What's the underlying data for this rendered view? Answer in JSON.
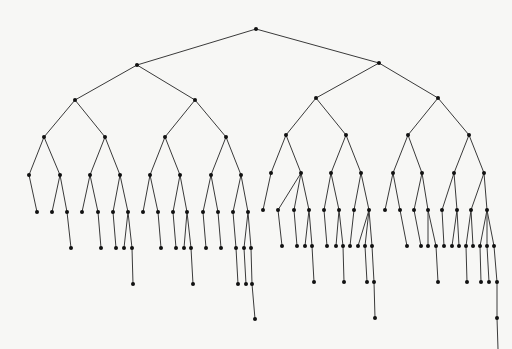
{
  "diagram": {
    "type": "binary-tree",
    "edge_color": "#3a3a3a",
    "node_color": "#111111",
    "background": "#f7f7f5",
    "node_radius": 2,
    "nodes": [
      {
        "id": 0,
        "x": 256,
        "y": 29,
        "parent": null
      },
      {
        "id": 1,
        "x": 137,
        "y": 65,
        "parent": 0
      },
      {
        "id": 2,
        "x": 379,
        "y": 63,
        "parent": 0
      },
      {
        "id": 3,
        "x": 75,
        "y": 100,
        "parent": 1
      },
      {
        "id": 4,
        "x": 195,
        "y": 100,
        "parent": 1
      },
      {
        "id": 5,
        "x": 316,
        "y": 98,
        "parent": 2
      },
      {
        "id": 6,
        "x": 438,
        "y": 98,
        "parent": 2
      },
      {
        "id": 7,
        "x": 44,
        "y": 137,
        "parent": 3
      },
      {
        "id": 8,
        "x": 105,
        "y": 137,
        "parent": 3
      },
      {
        "id": 9,
        "x": 165,
        "y": 137,
        "parent": 4
      },
      {
        "id": 10,
        "x": 226,
        "y": 137,
        "parent": 4
      },
      {
        "id": 11,
        "x": 286,
        "y": 135,
        "parent": 5
      },
      {
        "id": 12,
        "x": 346,
        "y": 135,
        "parent": 5
      },
      {
        "id": 13,
        "x": 408,
        "y": 135,
        "parent": 6
      },
      {
        "id": 14,
        "x": 469,
        "y": 135,
        "parent": 6
      },
      {
        "id": 15,
        "x": 29,
        "y": 175,
        "parent": 7
      },
      {
        "id": 16,
        "x": 60,
        "y": 175,
        "parent": 7
      },
      {
        "id": 17,
        "x": 90,
        "y": 175,
        "parent": 8
      },
      {
        "id": 18,
        "x": 120,
        "y": 175,
        "parent": 8
      },
      {
        "id": 19,
        "x": 150,
        "y": 175,
        "parent": 9
      },
      {
        "id": 20,
        "x": 180,
        "y": 175,
        "parent": 9
      },
      {
        "id": 21,
        "x": 211,
        "y": 175,
        "parent": 10
      },
      {
        "id": 22,
        "x": 241,
        "y": 175,
        "parent": 10
      },
      {
        "id": 23,
        "x": 271,
        "y": 173,
        "parent": 11
      },
      {
        "id": 24,
        "x": 301,
        "y": 173,
        "parent": 11
      },
      {
        "id": 25,
        "x": 331,
        "y": 173,
        "parent": 12
      },
      {
        "id": 26,
        "x": 361,
        "y": 173,
        "parent": 12
      },
      {
        "id": 27,
        "x": 393,
        "y": 173,
        "parent": 13
      },
      {
        "id": 28,
        "x": 422,
        "y": 173,
        "parent": 13
      },
      {
        "id": 29,
        "x": 454,
        "y": 173,
        "parent": 14
      },
      {
        "id": 30,
        "x": 484,
        "y": 173,
        "parent": 14
      },
      {
        "id": 31,
        "x": 37,
        "y": 212,
        "parent": 15
      },
      {
        "id": 32,
        "x": 52,
        "y": 212,
        "parent": 16
      },
      {
        "id": 33,
        "x": 67,
        "y": 212,
        "parent": 16
      },
      {
        "id": 34,
        "x": 82,
        "y": 212,
        "parent": 17
      },
      {
        "id": 35,
        "x": 98,
        "y": 212,
        "parent": 17
      },
      {
        "id": 36,
        "x": 113,
        "y": 212,
        "parent": 18
      },
      {
        "id": 37,
        "x": 128,
        "y": 212,
        "parent": 18
      },
      {
        "id": 38,
        "x": 143,
        "y": 212,
        "parent": 19
      },
      {
        "id": 39,
        "x": 158,
        "y": 212,
        "parent": 19
      },
      {
        "id": 40,
        "x": 173,
        "y": 212,
        "parent": 20
      },
      {
        "id": 41,
        "x": 187,
        "y": 212,
        "parent": 20
      },
      {
        "id": 42,
        "x": 203,
        "y": 212,
        "parent": 21
      },
      {
        "id": 43,
        "x": 218,
        "y": 212,
        "parent": 21
      },
      {
        "id": 44,
        "x": 233,
        "y": 212,
        "parent": 22
      },
      {
        "id": 45,
        "x": 248,
        "y": 212,
        "parent": 22
      },
      {
        "id": 46,
        "x": 263,
        "y": 210,
        "parent": 23
      },
      {
        "id": 47,
        "x": 278,
        "y": 210,
        "parent": 24
      },
      {
        "id": 48,
        "x": 294,
        "y": 210,
        "parent": 24
      },
      {
        "id": 49,
        "x": 309,
        "y": 210,
        "parent": 24
      },
      {
        "id": 50,
        "x": 324,
        "y": 210,
        "parent": 25
      },
      {
        "id": 51,
        "x": 339,
        "y": 210,
        "parent": 25
      },
      {
        "id": 52,
        "x": 354,
        "y": 210,
        "parent": 26
      },
      {
        "id": 53,
        "x": 369,
        "y": 210,
        "parent": 26
      },
      {
        "id": 54,
        "x": 385,
        "y": 210,
        "parent": 27
      },
      {
        "id": 55,
        "x": 400,
        "y": 210,
        "parent": 27
      },
      {
        "id": 56,
        "x": 414,
        "y": 210,
        "parent": 28
      },
      {
        "id": 57,
        "x": 428,
        "y": 210,
        "parent": 28
      },
      {
        "id": 58,
        "x": 442,
        "y": 210,
        "parent": 29
      },
      {
        "id": 59,
        "x": 457,
        "y": 210,
        "parent": 29
      },
      {
        "id": 60,
        "x": 471,
        "y": 210,
        "parent": 30
      },
      {
        "id": 61,
        "x": 487,
        "y": 210,
        "parent": 30
      },
      {
        "id": 62,
        "x": 71,
        "y": 248,
        "parent": 33
      },
      {
        "id": 63,
        "x": 101,
        "y": 248,
        "parent": 35
      },
      {
        "id": 64,
        "x": 116,
        "y": 248,
        "parent": 36
      },
      {
        "id": 65,
        "x": 124,
        "y": 248,
        "parent": 37
      },
      {
        "id": 66,
        "x": 132,
        "y": 248,
        "parent": 37
      },
      {
        "id": 67,
        "x": 161,
        "y": 248,
        "parent": 39
      },
      {
        "id": 68,
        "x": 176,
        "y": 248,
        "parent": 40
      },
      {
        "id": 69,
        "x": 184,
        "y": 248,
        "parent": 41
      },
      {
        "id": 70,
        "x": 191,
        "y": 248,
        "parent": 41
      },
      {
        "id": 71,
        "x": 206,
        "y": 248,
        "parent": 42
      },
      {
        "id": 72,
        "x": 221,
        "y": 248,
        "parent": 43
      },
      {
        "id": 73,
        "x": 236,
        "y": 248,
        "parent": 44
      },
      {
        "id": 74,
        "x": 244,
        "y": 248,
        "parent": 45
      },
      {
        "id": 75,
        "x": 251,
        "y": 248,
        "parent": 45
      },
      {
        "id": 76,
        "x": 282,
        "y": 246,
        "parent": 47
      },
      {
        "id": 77,
        "x": 297,
        "y": 246,
        "parent": 48
      },
      {
        "id": 78,
        "x": 305,
        "y": 246,
        "parent": 49
      },
      {
        "id": 79,
        "x": 312,
        "y": 246,
        "parent": 49
      },
      {
        "id": 80,
        "x": 327,
        "y": 246,
        "parent": 50
      },
      {
        "id": 81,
        "x": 336,
        "y": 246,
        "parent": 51
      },
      {
        "id": 82,
        "x": 343,
        "y": 246,
        "parent": 51
      },
      {
        "id": 83,
        "x": 350,
        "y": 246,
        "parent": 52
      },
      {
        "id": 84,
        "x": 358,
        "y": 246,
        "parent": 53
      },
      {
        "id": 85,
        "x": 365,
        "y": 246,
        "parent": 53
      },
      {
        "id": 86,
        "x": 372,
        "y": 246,
        "parent": 53
      },
      {
        "id": 87,
        "x": 407,
        "y": 246,
        "parent": 55
      },
      {
        "id": 88,
        "x": 421,
        "y": 246,
        "parent": 56
      },
      {
        "id": 89,
        "x": 428,
        "y": 246,
        "parent": 57
      },
      {
        "id": 90,
        "x": 436,
        "y": 246,
        "parent": 57
      },
      {
        "id": 91,
        "x": 444,
        "y": 246,
        "parent": 58
      },
      {
        "id": 92,
        "x": 452,
        "y": 246,
        "parent": 59
      },
      {
        "id": 93,
        "x": 459,
        "y": 246,
        "parent": 59
      },
      {
        "id": 94,
        "x": 466,
        "y": 246,
        "parent": 60
      },
      {
        "id": 95,
        "x": 473,
        "y": 246,
        "parent": 60
      },
      {
        "id": 96,
        "x": 480,
        "y": 246,
        "parent": 61
      },
      {
        "id": 97,
        "x": 487,
        "y": 246,
        "parent": 61
      },
      {
        "id": 98,
        "x": 494,
        "y": 246,
        "parent": 61
      },
      {
        "id": 99,
        "x": 133,
        "y": 284,
        "parent": 66
      },
      {
        "id": 100,
        "x": 193,
        "y": 284,
        "parent": 70
      },
      {
        "id": 101,
        "x": 238,
        "y": 284,
        "parent": 73
      },
      {
        "id": 102,
        "x": 246,
        "y": 284,
        "parent": 74
      },
      {
        "id": 103,
        "x": 252,
        "y": 284,
        "parent": 75
      },
      {
        "id": 104,
        "x": 314,
        "y": 282,
        "parent": 79
      },
      {
        "id": 105,
        "x": 344,
        "y": 282,
        "parent": 82
      },
      {
        "id": 106,
        "x": 367,
        "y": 282,
        "parent": 85
      },
      {
        "id": 107,
        "x": 374,
        "y": 282,
        "parent": 86
      },
      {
        "id": 108,
        "x": 438,
        "y": 282,
        "parent": 90
      },
      {
        "id": 109,
        "x": 467,
        "y": 282,
        "parent": 94
      },
      {
        "id": 110,
        "x": 481,
        "y": 282,
        "parent": 96
      },
      {
        "id": 111,
        "x": 489,
        "y": 282,
        "parent": 97
      },
      {
        "id": 112,
        "x": 497,
        "y": 282,
        "parent": 98
      },
      {
        "id": 113,
        "x": 255,
        "y": 319,
        "parent": 103
      },
      {
        "id": 114,
        "x": 375,
        "y": 318,
        "parent": 107
      },
      {
        "id": 115,
        "x": 497,
        "y": 318,
        "parent": 112
      },
      {
        "id": 116,
        "x": 498,
        "y": 349,
        "parent": 115,
        "hidden": true
      }
    ]
  }
}
